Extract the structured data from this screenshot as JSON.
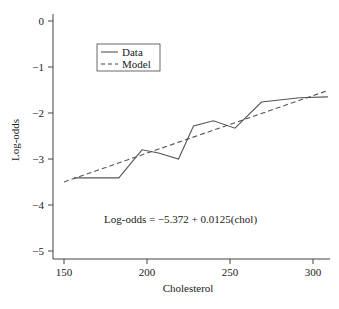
{
  "chart_data": {
    "type": "line",
    "title": "",
    "xlabel": "Cholesterol",
    "ylabel": "Log-odds",
    "xlim": [
      143,
      310
    ],
    "ylim": [
      -5.2,
      0.2
    ],
    "xticks": [
      150,
      200,
      250,
      300
    ],
    "yticks": [
      0,
      -1,
      -2,
      -3,
      -4,
      -5
    ],
    "grid": false,
    "legend": {
      "position": "upper-left",
      "entries": [
        {
          "label": "Data",
          "style": "solid"
        },
        {
          "label": "Model",
          "style": "dashed"
        }
      ]
    },
    "series": [
      {
        "name": "Data",
        "style": "solid",
        "x": [
          156,
          183,
          197,
          207,
          219,
          228,
          240,
          253,
          269,
          292,
          309
        ],
        "y": [
          -3.41,
          -3.41,
          -2.8,
          -2.87,
          -3.0,
          -2.28,
          -2.17,
          -2.33,
          -1.76,
          -1.67,
          -1.65
        ]
      },
      {
        "name": "Model",
        "style": "dashed",
        "intercept": -5.372,
        "slope": 0.0125,
        "x": [
          150,
          309
        ],
        "y": [
          -3.497,
          -1.51
        ]
      }
    ],
    "annotations": [
      {
        "text": "Log-odds = −5.372 + 0.0125(chol)",
        "x": 225,
        "y": -4.35
      }
    ]
  },
  "labels": {
    "xlabel": "Cholesterol",
    "ylabel": "Log-odds",
    "legend_data": "Data",
    "legend_model": "Model",
    "equation": "Log-odds = −5.372 + 0.0125(chol)"
  }
}
